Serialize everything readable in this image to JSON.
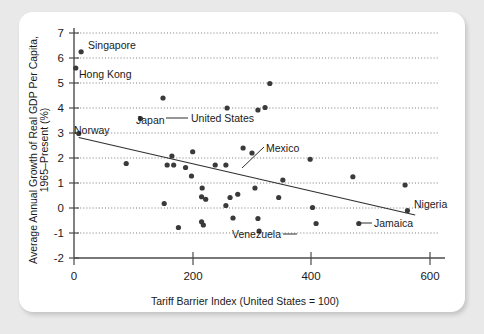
{
  "chart_data": {
    "type": "scatter",
    "title": "",
    "xlabel": "Tariff Barrier Index (United States = 100)",
    "ylabel": "Average Annual Growth of Real GDP Per Capita, 1965–Present (%)",
    "ylabel_line1": "Average Annual Growth of Real GDP Per Capita,",
    "ylabel_line2": "1965–Present (%)",
    "xlim": [
      0,
      640
    ],
    "ylim": [
      -2,
      7
    ],
    "xticks": [
      0,
      200,
      400,
      600
    ],
    "xtick_labels": [
      "0",
      "200",
      "400",
      "600"
    ],
    "yticks": [
      -2,
      -1,
      0,
      1,
      2,
      3,
      4,
      5,
      6,
      7
    ],
    "ytick_labels": [
      "-2",
      "-1",
      "0",
      "1",
      "2",
      "3",
      "4",
      "5",
      "6",
      "7"
    ],
    "gridlines_y": [
      -1,
      0,
      1,
      2,
      3,
      4,
      5,
      6,
      7
    ],
    "grid": "horizontal-dotted",
    "legend": "none",
    "marker_color": "#3a3a3a",
    "trendline_color": "#2f2f2f",
    "trendline": {
      "x1": 8,
      "y1": 2.82,
      "x2": 575,
      "y2": -0.28
    },
    "points": [
      {
        "x": 12,
        "y": 6.25,
        "label": "Singapore",
        "label_pos": "right"
      },
      {
        "x": 3,
        "y": 5.6,
        "label": "Hong Kong",
        "label_pos": "below-right"
      },
      {
        "x": 330,
        "y": 4.98,
        "label": "",
        "label_pos": ""
      },
      {
        "x": 150,
        "y": 4.4,
        "label": "United States",
        "label_pos": "right-leader"
      },
      {
        "x": 112,
        "y": 3.58,
        "label": "Japan",
        "label_pos": "right"
      },
      {
        "x": 8,
        "y": 2.98,
        "label": "Norway",
        "label_pos": "left"
      },
      {
        "x": 258,
        "y": 4.0,
        "label": "",
        "label_pos": ""
      },
      {
        "x": 310,
        "y": 3.92,
        "label": "",
        "label_pos": ""
      },
      {
        "x": 322,
        "y": 4.02,
        "label": "",
        "label_pos": ""
      },
      {
        "x": 88,
        "y": 1.78,
        "label": "",
        "label_pos": ""
      },
      {
        "x": 157,
        "y": 1.72,
        "label": "",
        "label_pos": ""
      },
      {
        "x": 168,
        "y": 1.72,
        "label": "",
        "label_pos": ""
      },
      {
        "x": 165,
        "y": 2.08,
        "label": "",
        "label_pos": ""
      },
      {
        "x": 188,
        "y": 1.62,
        "label": "",
        "label_pos": ""
      },
      {
        "x": 200,
        "y": 2.25,
        "label": "",
        "label_pos": ""
      },
      {
        "x": 198,
        "y": 1.28,
        "label": "",
        "label_pos": ""
      },
      {
        "x": 216,
        "y": 0.8,
        "label": "",
        "label_pos": ""
      },
      {
        "x": 215,
        "y": 0.45,
        "label": "",
        "label_pos": ""
      },
      {
        "x": 222,
        "y": 0.35,
        "label": "",
        "label_pos": ""
      },
      {
        "x": 152,
        "y": 0.18,
        "label": "",
        "label_pos": ""
      },
      {
        "x": 176,
        "y": -0.78,
        "label": "",
        "label_pos": ""
      },
      {
        "x": 215,
        "y": -0.55,
        "label": "",
        "label_pos": ""
      },
      {
        "x": 218,
        "y": -0.68,
        "label": "",
        "label_pos": ""
      },
      {
        "x": 256,
        "y": 1.72,
        "label": "",
        "label_pos": ""
      },
      {
        "x": 263,
        "y": 0.42,
        "label": "",
        "label_pos": ""
      },
      {
        "x": 256,
        "y": 0.1,
        "label": "",
        "label_pos": ""
      },
      {
        "x": 268,
        "y": -0.4,
        "label": "",
        "label_pos": ""
      },
      {
        "x": 276,
        "y": 0.55,
        "label": "",
        "label_pos": ""
      },
      {
        "x": 238,
        "y": 1.72,
        "label": "Mexico",
        "label_pos": "upper-right-leader"
      },
      {
        "x": 285,
        "y": 2.4,
        "label": "",
        "label_pos": ""
      },
      {
        "x": 300,
        "y": 2.2,
        "label": "",
        "label_pos": ""
      },
      {
        "x": 305,
        "y": 0.8,
        "label": "",
        "label_pos": ""
      },
      {
        "x": 310,
        "y": -0.42,
        "label": "",
        "label_pos": ""
      },
      {
        "x": 312,
        "y": -0.92,
        "label": "Venezuela",
        "label_pos": "left-leader"
      },
      {
        "x": 352,
        "y": 1.12,
        "label": "",
        "label_pos": ""
      },
      {
        "x": 345,
        "y": 0.42,
        "label": "",
        "label_pos": ""
      },
      {
        "x": 398,
        "y": 1.95,
        "label": "",
        "label_pos": ""
      },
      {
        "x": 402,
        "y": 0.02,
        "label": "",
        "label_pos": ""
      },
      {
        "x": 408,
        "y": -0.62,
        "label": "Jamaica",
        "label_pos": "right-leader"
      },
      {
        "x": 470,
        "y": 1.25,
        "label": "",
        "label_pos": ""
      },
      {
        "x": 480,
        "y": -0.62,
        "label": "",
        "label_pos": ""
      },
      {
        "x": 558,
        "y": 0.92,
        "label": "Nigeria",
        "label_pos": "right"
      },
      {
        "x": 562,
        "y": -0.1,
        "label": "",
        "label_pos": ""
      }
    ],
    "annotations": [
      {
        "name": "singapore-label",
        "text": "Singapore"
      },
      {
        "name": "hong-kong-label",
        "text": "Hong Kong"
      },
      {
        "name": "united-states-label",
        "text": "United States"
      },
      {
        "name": "japan-label",
        "text": "Japan"
      },
      {
        "name": "norway-label",
        "text": "Norway"
      },
      {
        "name": "mexico-label",
        "text": "Mexico"
      },
      {
        "name": "venezuela-label",
        "text": "Venezuela"
      },
      {
        "name": "jamaica-label",
        "text": "Jamaica"
      },
      {
        "name": "nigeria-label",
        "text": "Nigeria"
      }
    ]
  },
  "labels": {
    "singapore": "Singapore",
    "hong_kong": "Hong Kong",
    "united_states": "United States",
    "japan": "Japan",
    "norway": "Norway",
    "mexico": "Mexico",
    "venezuela": "Venezuela",
    "jamaica": "Jamaica",
    "nigeria": "Nigeria"
  },
  "axes": {
    "x_title": "Tariff Barrier Index (United States = 100)",
    "y_title_line1": "Average Annual Growth of Real GDP Per Capita,",
    "y_title_line2": "1965–Present (%)",
    "x_tick_0": "0",
    "x_tick_200": "200",
    "x_tick_400": "400",
    "x_tick_600": "600",
    "y_tick_m2": "-2",
    "y_tick_m1": "-1",
    "y_tick_0": "0",
    "y_tick_1": "1",
    "y_tick_2": "2",
    "y_tick_3": "3",
    "y_tick_4": "4",
    "y_tick_5": "5",
    "y_tick_6": "6",
    "y_tick_7": "7"
  },
  "colors": {
    "page_background": "#e9e9e9",
    "card_background": "#ffffff",
    "marker": "#3a3a3a",
    "axis": "#4b4b4b",
    "grid": "#6d6d6d",
    "text": "#1a1a1a"
  }
}
